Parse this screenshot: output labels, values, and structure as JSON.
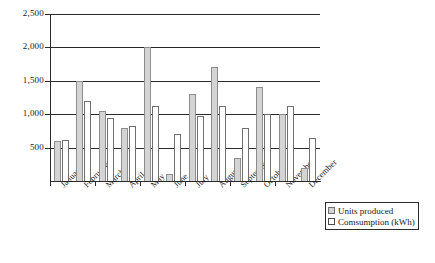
{
  "chart_data": {
    "type": "bar",
    "title": "",
    "subtitle": "",
    "xlabel": "",
    "ylabel": "",
    "ylim": [
      0,
      2500
    ],
    "yticks": [
      500,
      1000,
      1500,
      2000,
      2500
    ],
    "ytick_labels": [
      "500",
      "1,000",
      "1,500",
      "2,000",
      "2,500"
    ],
    "grid": true,
    "grid_axis": "y",
    "legend_position": "bottom-right",
    "categories": [
      "January",
      "February",
      "March",
      "April",
      "May",
      "June",
      "July",
      "August",
      "September",
      "October",
      "November",
      "December"
    ],
    "series": [
      {
        "name": "Units produced",
        "color": "#d4d4d4",
        "values": [
          600,
          1500,
          1050,
          800,
          2000,
          100,
          1300,
          1700,
          350,
          1400,
          1000,
          200
        ]
      },
      {
        "name": "Comsumption (kWh)",
        "color": "#ffffff",
        "values": [
          620,
          1200,
          950,
          830,
          1130,
          700,
          980,
          1130,
          800,
          1000,
          1120,
          650
        ]
      }
    ]
  },
  "legend": {
    "items": [
      {
        "label": "Units produced",
        "swatch": "produced-swatch"
      },
      {
        "label": "Comsumption (kWh)",
        "swatch": "consumption-swatch"
      }
    ]
  }
}
